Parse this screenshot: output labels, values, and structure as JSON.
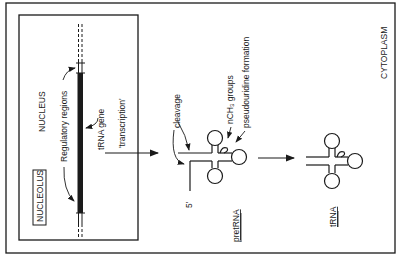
{
  "diagram": {
    "compartments": {
      "nucleus": "NUCLEUS",
      "nucleolus": "NUCLEOLUS",
      "cytoplasm": "CYTOPLASM"
    },
    "gene_labels": {
      "regulatory": "Regulatory regions",
      "gene": "tRNA gene",
      "process": "'transcription'"
    },
    "processing_labels": {
      "cleavage": "cleavage",
      "methyl": "nCH₃ groups",
      "pseudouridine": "pseudouridine formation",
      "five_prime": "5'"
    },
    "molecules": {
      "pre": "pretRNA",
      "mature": "tRNA"
    },
    "colors": {
      "ink": "#1a1a1a",
      "background": "#ffffff"
    }
  }
}
